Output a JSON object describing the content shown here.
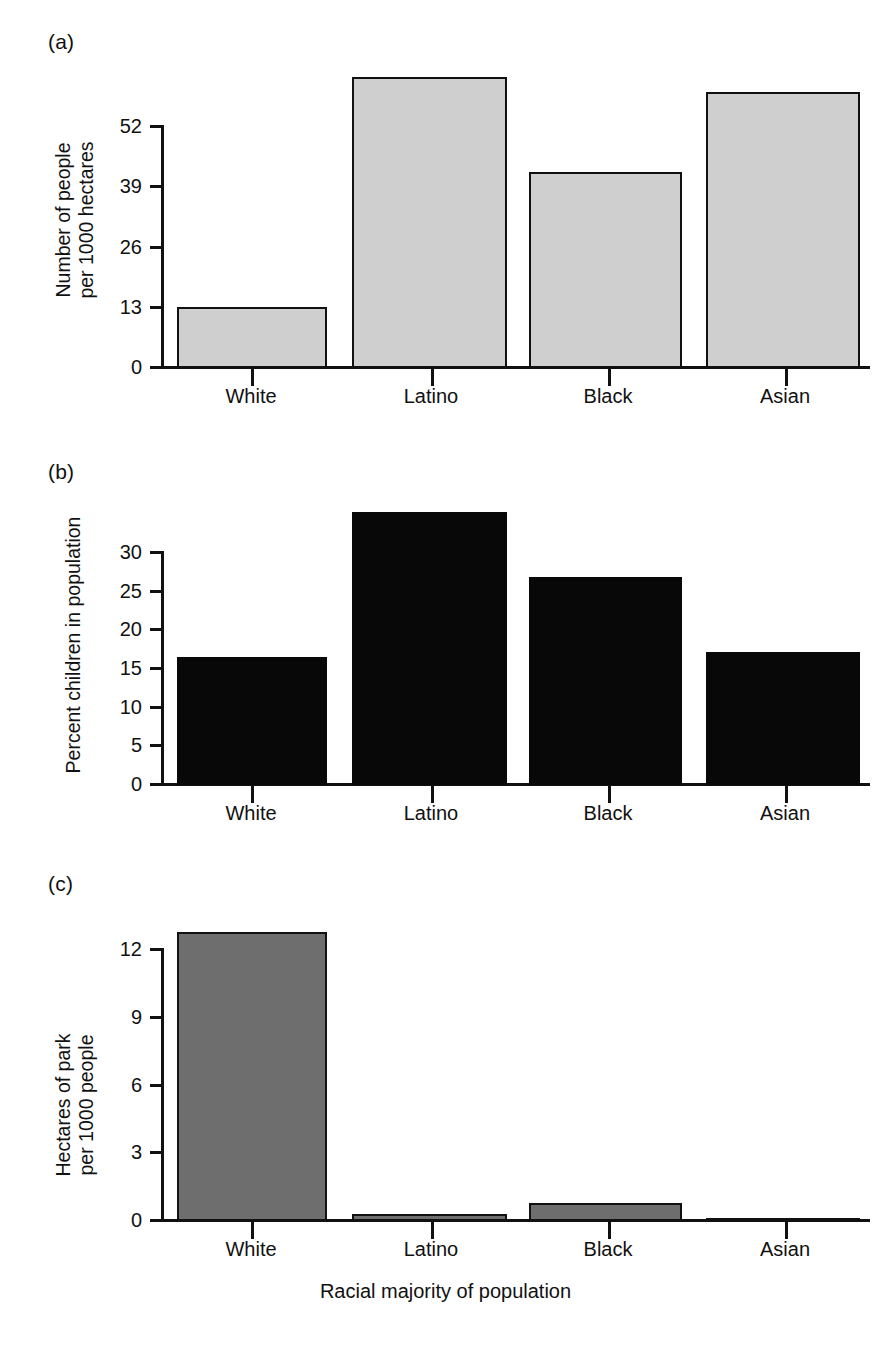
{
  "figure": {
    "xaxis_title": "Racial majority of population",
    "categories": [
      "White",
      "Latino",
      "Black",
      "Asian"
    ]
  },
  "panels": [
    {
      "tag": "(a)",
      "ylabel": "Number of people\nper 1000 hectares",
      "yticks": [
        "0",
        "13",
        "26",
        "39",
        "52"
      ],
      "xticks": [
        "White",
        "Latino",
        "Black",
        "Asian"
      ],
      "bar_style": "light",
      "bar_fill": "#cfcfcf",
      "bar_stroke": "#111111"
    },
    {
      "tag": "(b)",
      "ylabel": "Percent children in population",
      "yticks": [
        "0",
        "5",
        "10",
        "15",
        "20",
        "25",
        "30"
      ],
      "xticks": [
        "White",
        "Latino",
        "Black",
        "Asian"
      ],
      "bar_style": "black",
      "bar_fill": "#080808",
      "bar_stroke": "#080808"
    },
    {
      "tag": "(c)",
      "ylabel": "Hectares of park\nper 1000 people",
      "yticks": [
        "0",
        "3",
        "6",
        "9",
        "12"
      ],
      "xticks": [
        "White",
        "Latino",
        "Black",
        "Asian"
      ],
      "bar_style": "gray",
      "bar_fill": "#6e6e6e",
      "bar_stroke": "#111111"
    }
  ],
  "chart_data": [
    {
      "type": "bar",
      "panel": "(a)",
      "title": "",
      "categories": [
        "White",
        "Latino",
        "Black",
        "Asian"
      ],
      "values": [
        13.2,
        62.8,
        42.3,
        59.5
      ],
      "xlabel": "Racial majority of population",
      "ylabel": "Number of people per 1000 hectares",
      "ytick_values": [
        0,
        13,
        26,
        39,
        52
      ],
      "ylim": [
        0,
        65
      ],
      "axis_max_tick": 52,
      "grid": false,
      "legend": "none",
      "bar_fill": "#cfcfcf",
      "bar_stroke": "#111111"
    },
    {
      "type": "bar",
      "panel": "(b)",
      "title": "",
      "categories": [
        "White",
        "Latino",
        "Black",
        "Asian"
      ],
      "values": [
        16.5,
        35.3,
        26.9,
        17.2
      ],
      "xlabel": "Racial majority of population",
      "ylabel": "Percent children in population",
      "ytick_values": [
        0,
        5,
        10,
        15,
        20,
        25,
        30
      ],
      "ylim": [
        0,
        36
      ],
      "axis_max_tick": 30,
      "grid": false,
      "legend": "none",
      "bar_fill": "#080808",
      "bar_stroke": "#080808"
    },
    {
      "type": "bar",
      "panel": "(c)",
      "title": "",
      "categories": [
        "White",
        "Latino",
        "Black",
        "Asian"
      ],
      "values": [
        12.8,
        0.3,
        0.8,
        0.15
      ],
      "xlabel": "Racial majority of population",
      "ylabel": "Hectares of park per 1000 people",
      "ytick_values": [
        0,
        3,
        6,
        9,
        12
      ],
      "ylim": [
        0,
        13
      ],
      "axis_max_tick": 12,
      "grid": false,
      "legend": "none",
      "bar_fill": "#6e6e6e",
      "bar_stroke": "#111111"
    }
  ]
}
